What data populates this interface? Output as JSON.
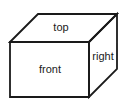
{
  "diagram": {
    "type": "cube-faces",
    "labels": {
      "top": "top",
      "front": "front",
      "right": "right"
    },
    "colors": {
      "stroke": "#1a1a1a",
      "background": "#ffffff"
    }
  }
}
